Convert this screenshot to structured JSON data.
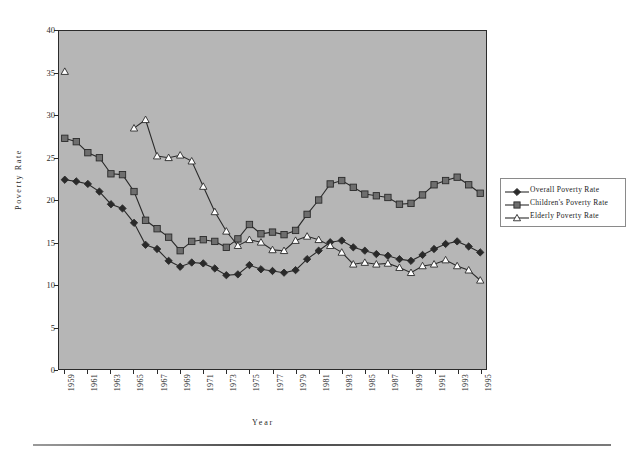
{
  "chart_data": {
    "type": "line",
    "title": "",
    "xlabel": "Year",
    "ylabel": "Poverty  Rate",
    "ylim": [
      0,
      40
    ],
    "ytick_step": 5,
    "yticks": [
      0,
      5,
      10,
      15,
      20,
      25,
      30,
      35,
      40
    ],
    "grid": false,
    "legend_position": "right",
    "plot_background": "#b6b6b6",
    "x": [
      1959,
      1960,
      1961,
      1962,
      1963,
      1964,
      1965,
      1966,
      1967,
      1968,
      1969,
      1970,
      1971,
      1972,
      1973,
      1974,
      1975,
      1976,
      1977,
      1978,
      1979,
      1980,
      1981,
      1982,
      1983,
      1984,
      1985,
      1986,
      1987,
      1988,
      1989,
      1990,
      1991,
      1992,
      1993,
      1994,
      1995
    ],
    "xtick_labels": [
      "1959",
      "1961",
      "1963",
      "1965",
      "1967",
      "1969",
      "1971",
      "1973",
      "1975",
      "1977",
      "1979",
      "1981",
      "1983",
      "1985",
      "1987",
      "1989",
      "1991",
      "1993",
      "1995"
    ],
    "series": [
      {
        "name": "Overall  Poverty  Rate",
        "marker": "diamond",
        "color": "#2a2a2a",
        "fill": "#2a2a2a",
        "values": [
          22.4,
          22.2,
          21.9,
          21.0,
          19.5,
          19.0,
          17.3,
          14.7,
          14.2,
          12.8,
          12.1,
          12.6,
          12.5,
          11.9,
          11.1,
          11.2,
          12.3,
          11.8,
          11.6,
          11.4,
          11.7,
          13.0,
          14.0,
          15.0,
          15.2,
          14.4,
          14.0,
          13.6,
          13.4,
          13.0,
          12.8,
          13.5,
          14.2,
          14.8,
          15.1,
          14.5,
          13.8
        ]
      },
      {
        "name": "Children's  Poverty  Rate",
        "marker": "square",
        "color": "#2a2a2a",
        "fill": "#6e6e6e",
        "values": [
          27.3,
          26.9,
          25.6,
          25.0,
          23.1,
          23.0,
          21.0,
          17.6,
          16.6,
          15.6,
          14.0,
          15.1,
          15.3,
          15.1,
          14.4,
          15.4,
          17.1,
          16.0,
          16.2,
          15.9,
          16.4,
          18.3,
          20.0,
          21.9,
          22.3,
          21.5,
          20.7,
          20.5,
          20.3,
          19.5,
          19.6,
          20.6,
          21.8,
          22.3,
          22.7,
          21.8,
          20.8
        ]
      },
      {
        "name": "Elderly  Poverty  Rate",
        "marker": "triangle",
        "color": "#2a2a2a",
        "fill": "#ffffff",
        "values": [
          35.2,
          null,
          null,
          null,
          null,
          null,
          28.5,
          29.5,
          25.2,
          25.0,
          25.3,
          24.6,
          21.6,
          18.6,
          16.3,
          14.6,
          15.3,
          15.0,
          14.1,
          14.0,
          15.2,
          15.7,
          15.3,
          14.6,
          13.8,
          12.4,
          12.6,
          12.4,
          12.5,
          12.0,
          11.4,
          12.2,
          12.4,
          12.9,
          12.2,
          11.7,
          10.5
        ]
      }
    ]
  },
  "axis": {
    "y_title": "Poverty  Rate",
    "x_title": "Year"
  }
}
